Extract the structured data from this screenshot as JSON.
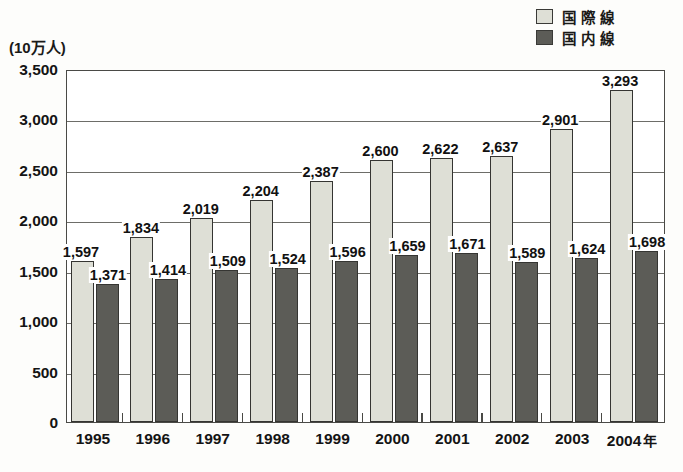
{
  "unit_label": "(10万人)",
  "legend": {
    "position": "top-right",
    "items": [
      {
        "label": "国際線",
        "key": "international",
        "color": "#dedfd6",
        "swatch_icon": "light-hatched-square-icon"
      },
      {
        "label": "国内線",
        "key": "domestic",
        "color": "#5c5c57",
        "swatch_icon": "dark-hatched-square-icon"
      }
    ]
  },
  "axis": {
    "x_suffix": "年",
    "y_ticks": [
      "0",
      "500",
      "1,000",
      "1,500",
      "2,000",
      "2,500",
      "3,000",
      "3,500"
    ]
  },
  "chart_data": {
    "type": "bar",
    "title": "",
    "xlabel": "年",
    "ylabel": "(10万人)",
    "ylim": [
      0,
      3500
    ],
    "ytick_values": [
      0,
      500,
      1000,
      1500,
      2000,
      2500,
      3000,
      3500
    ],
    "grid": true,
    "legend_position": "top-right",
    "categories": [
      "1995",
      "1996",
      "1997",
      "1998",
      "1999",
      "2000",
      "2001",
      "2002",
      "2003",
      "2004"
    ],
    "series": [
      {
        "name": "国際線",
        "color": "#dedfd6",
        "values": [
          1597,
          1834,
          2019,
          2204,
          2387,
          2600,
          2622,
          2637,
          2901,
          3293
        ],
        "labels": [
          "1,597",
          "1,834",
          "2,019",
          "2,204",
          "2,387",
          "2,600",
          "2,622",
          "2,637",
          "2,901",
          "3,293"
        ]
      },
      {
        "name": "国内線",
        "color": "#5c5c57",
        "values": [
          1371,
          1414,
          1509,
          1524,
          1596,
          1659,
          1671,
          1589,
          1624,
          1698
        ],
        "labels": [
          "1,371",
          "1,414",
          "1,509",
          "1,524",
          "1,596",
          "1,659",
          "1,671",
          "1,589",
          "1,624",
          "1,698"
        ]
      }
    ]
  }
}
